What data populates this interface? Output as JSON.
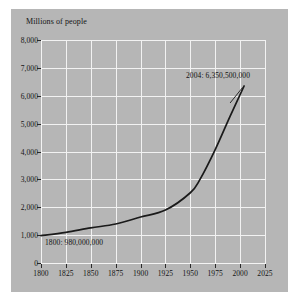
{
  "chart_data": {
    "type": "line",
    "title": "",
    "subtitle": "",
    "xlabel": "",
    "ylabel": "Millions of people",
    "ylim": [
      0,
      8000
    ],
    "xlim": [
      1800,
      2025
    ],
    "grid": true,
    "legend": "none",
    "x_ticks": [
      "1800",
      "1825",
      "1850",
      "1875",
      "1900",
      "1925",
      "1950",
      "1975",
      "2000",
      "2025"
    ],
    "x_tick_values": [
      1800,
      1825,
      1850,
      1875,
      1900,
      1925,
      1950,
      1975,
      2000,
      2025
    ],
    "y_ticks": [
      "0",
      "1,000",
      "2,000",
      "3,000",
      "4,000",
      "5,000",
      "6,000",
      "7,000",
      "8,000"
    ],
    "y_tick_values": [
      0,
      1000,
      2000,
      3000,
      4000,
      5000,
      6000,
      7000,
      8000
    ],
    "series": [
      {
        "name": "World population",
        "x": [
          1800,
          1825,
          1850,
          1875,
          1900,
          1925,
          1950,
          1960,
          1975,
          1990,
          2004
        ],
        "values": [
          980,
          1100,
          1260,
          1400,
          1650,
          1900,
          2520,
          3020,
          4070,
          5270,
          6350
        ]
      }
    ],
    "annotations": [
      {
        "id": "start-point",
        "label": "1800:  980,000,000",
        "x": 1800,
        "y": 980
      },
      {
        "id": "end-point",
        "label": "2004:  6,350,500,000",
        "x": 2004,
        "y": 6350.5
      }
    ],
    "colors": {
      "panel_background": "#b6b6b6",
      "figure_background": "#ffffff",
      "gridline": "#f2f2f2",
      "line": "#1a1a1a",
      "text": "#141414"
    }
  }
}
